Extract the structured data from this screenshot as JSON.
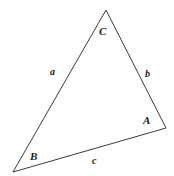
{
  "figure": {
    "type": "triangle-diagram",
    "background_color": "#ffffff",
    "stroke_color": "#3a3a3a",
    "stroke_width": 1,
    "text_color": "#1a1a1a",
    "canvas": {
      "width": 174,
      "height": 176
    },
    "vertices": [
      {
        "name": "C",
        "label": "C",
        "x": 106,
        "y": 10,
        "label_x": 99,
        "label_y": 26
      },
      {
        "name": "A",
        "label": "A",
        "x": 166,
        "y": 128,
        "label_x": 143,
        "label_y": 115
      },
      {
        "name": "B",
        "label": "B",
        "x": 13,
        "y": 172,
        "label_x": 30,
        "label_y": 151
      }
    ],
    "sides": [
      {
        "name": "a",
        "label": "a",
        "from": "B",
        "to": "C",
        "label_x": 50,
        "label_y": 67
      },
      {
        "name": "b",
        "label": "b",
        "from": "C",
        "to": "A",
        "label_x": 145,
        "label_y": 69
      },
      {
        "name": "c",
        "label": "c",
        "from": "B",
        "to": "A",
        "label_x": 92,
        "label_y": 156
      }
    ],
    "polygon_points": "106,10 166,128 13,172"
  }
}
